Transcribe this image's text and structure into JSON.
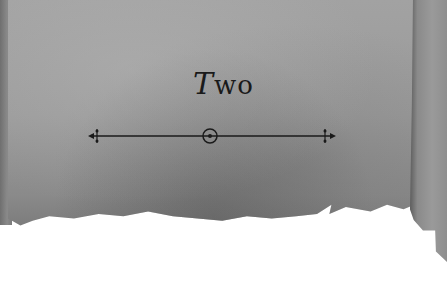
{
  "heading": {
    "initial": "T",
    "rest": "wo",
    "full": "Two"
  },
  "ornament": {
    "type": "divider-with-center-circle"
  },
  "colors": {
    "parchment": "#9a9a9a",
    "ink": "#1a1a1a",
    "background": "#ffffff"
  }
}
